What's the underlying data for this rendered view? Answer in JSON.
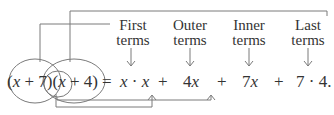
{
  "labels": {
    "first": [
      "First",
      "terms"
    ],
    "outer": [
      "Outer",
      "terms"
    ],
    "inner": [
      "Inner",
      "terms"
    ],
    "last": [
      "Last",
      "terms"
    ]
  },
  "equation": {
    "lhs_open1": "(",
    "lhs_x1": "x",
    "lhs_plus1": " + 7)(",
    "lhs_x2": "x",
    "lhs_plus2": " + 4)",
    "equals": "=",
    "term1_a": "x",
    "term1_dot": " · ",
    "term1_b": "x",
    "plus_a": "+",
    "term2_num": "4",
    "term2_var": "x",
    "plus_b": "+",
    "term3_num": "7",
    "term3_var": "x",
    "plus_c": "+",
    "term4": "7 · 4."
  },
  "colors": {
    "line": "#7a7a7a",
    "text": "#333333"
  }
}
